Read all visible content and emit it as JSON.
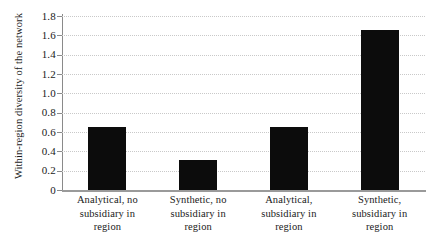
{
  "chart_data": {
    "type": "bar",
    "title": "",
    "subtitle": "",
    "xlabel": "",
    "ylabel": "Within-region diversity of the network",
    "categories": [
      "Analytical, no subsidiary in region",
      "Synthetic, no subsidiary in region",
      "Analytical, subsidiary in region",
      "Synthetic, subsidiary in region"
    ],
    "category_lines": [
      [
        "Analytical, no",
        "subsidiary in",
        "region"
      ],
      [
        "Synthetic, no",
        "subsidiary in",
        "region"
      ],
      [
        "Analytical,",
        "subsidiary in",
        "region"
      ],
      [
        "Synthetic,",
        "subsidiary in",
        "region"
      ]
    ],
    "values": [
      0.65,
      0.31,
      0.65,
      1.66
    ],
    "ylim": [
      0,
      1.8
    ],
    "ytick_labels": [
      "1.8",
      "1.6",
      "1.4",
      "1.2",
      "1.0",
      "0.8",
      "0.6",
      "0.4",
      "0.2",
      "0"
    ],
    "ytick_values": [
      1.8,
      1.6,
      1.4,
      1.2,
      1.0,
      0.8,
      0.6,
      0.4,
      0.2,
      0
    ],
    "grid": true,
    "grid_style": "dotted",
    "legend": false,
    "legend_position": "none",
    "bar_color": "#0c0c0c",
    "grid_color": "#c9c9c9",
    "axis_color": "#8a8a8a",
    "background_color": "#ffffff"
  }
}
